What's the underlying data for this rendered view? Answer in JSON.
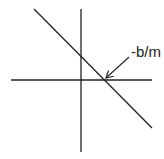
{
  "diagram": {
    "type": "line-intercept-sketch",
    "x_intercept_label": "-b/m",
    "colors": {
      "stroke": "#222222",
      "background": "#ffffff"
    },
    "axes": {
      "horizontal": {
        "x1": 11,
        "y1": 80,
        "x2": 152,
        "y2": 80
      },
      "vertical": {
        "x1": 81,
        "y1": 9,
        "x2": 81,
        "y2": 152
      }
    },
    "line": {
      "x1": 34,
      "y1": 9,
      "x2": 152,
      "y2": 128
    },
    "arrow": {
      "x1": 129,
      "y1": 57,
      "x2": 106,
      "y2": 78
    }
  }
}
